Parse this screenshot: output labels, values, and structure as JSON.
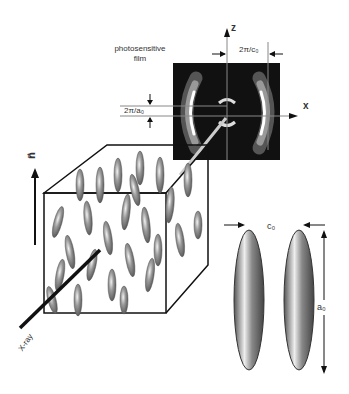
{
  "diagram": {
    "film_label_line1": "photosensitive",
    "film_label_line2": "film",
    "axis_z": "z",
    "axis_x": "x",
    "spacing_c": "2π/c₀",
    "spacing_a": "2π/a₀",
    "director_label": "n⃗",
    "xray_label": "X-ray",
    "molecule_width_label": "c₀",
    "molecule_length_label": "a₀"
  }
}
